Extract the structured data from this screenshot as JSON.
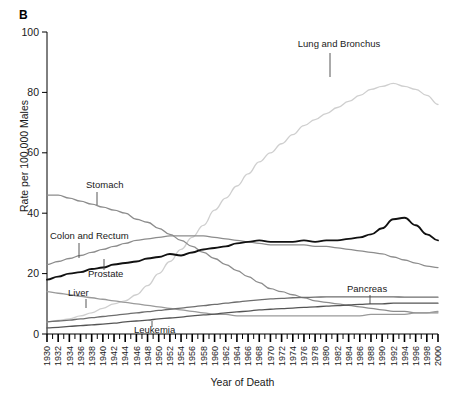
{
  "panel": {
    "letter": "B"
  },
  "axes": {
    "ylabel": "Rate per 100,000 Males",
    "xlabel": "Year of Death",
    "yticks": [
      "0",
      "20",
      "40",
      "60",
      "80",
      "100"
    ],
    "xticks": [
      "1930",
      "1932",
      "1934",
      "1936",
      "1938",
      "1940",
      "1942",
      "1944",
      "1946",
      "1948",
      "1950",
      "1952",
      "1954",
      "1956",
      "1958",
      "1960",
      "1962",
      "1964",
      "1966",
      "1968",
      "1970",
      "1972",
      "1974",
      "1976",
      "1978",
      "1980",
      "1982",
      "1984",
      "1986",
      "1988",
      "1990",
      "1992",
      "1994",
      "1996",
      "1998",
      "2000"
    ]
  },
  "annotations": [
    {
      "name": "lung-and-bronchus",
      "label": "Lung and Bronchus"
    },
    {
      "name": "stomach",
      "label": "Stomach"
    },
    {
      "name": "colon-and-rectum",
      "label": "Colon and Rectum"
    },
    {
      "name": "prostate",
      "label": "Prostate"
    },
    {
      "name": "liver",
      "label": "Liver"
    },
    {
      "name": "leukemia",
      "label": "Leukemia"
    },
    {
      "name": "pancreas",
      "label": "Pancreas"
    }
  ],
  "colors": {
    "lung": "#cfcfcf",
    "stomach": "#8c8c8c",
    "colon": "#8c8c8c",
    "prostate": "#111111",
    "liver": "#9a9a9a",
    "leukemia": "#555555",
    "pancreas": "#6e6e6e",
    "axis": "#000000",
    "text": "#1a1a1a"
  },
  "chart_data": {
    "type": "line",
    "title": "",
    "subtitle": "",
    "xlabel": "Year of Death",
    "ylabel": "Rate per 100,000 Males",
    "xlim": [
      1930,
      2000
    ],
    "ylim": [
      0,
      100
    ],
    "grid": false,
    "legend": "inline-annotations",
    "x": [
      1930,
      1932,
      1934,
      1936,
      1938,
      1940,
      1942,
      1944,
      1946,
      1948,
      1950,
      1952,
      1954,
      1956,
      1958,
      1960,
      1962,
      1964,
      1966,
      1968,
      1970,
      1972,
      1974,
      1976,
      1978,
      1980,
      1982,
      1984,
      1986,
      1988,
      1990,
      1992,
      1994,
      1996,
      1998,
      2000
    ],
    "series": [
      {
        "name": "Lung and Bronchus",
        "color": "#cfcfcf",
        "values": [
          4,
          4.5,
          5,
          6,
          7,
          8.5,
          10,
          11,
          13,
          16,
          20,
          24,
          28,
          32,
          36,
          41,
          45,
          49,
          53,
          57,
          60,
          63,
          66,
          69,
          71,
          73,
          75,
          77,
          79,
          81,
          82,
          83,
          82,
          81,
          79,
          76
        ]
      },
      {
        "name": "Stomach",
        "color": "#8c8c8c",
        "values": [
          46,
          46,
          45,
          44,
          43,
          42,
          41,
          40,
          38,
          37,
          35,
          33,
          31,
          29,
          27,
          25,
          23,
          21,
          19,
          17,
          15,
          14,
          13,
          12,
          11,
          10.5,
          10,
          9.5,
          9,
          8.5,
          8,
          7.5,
          7.5,
          7,
          7,
          7
        ]
      },
      {
        "name": "Colon and Rectum",
        "color": "#8c8c8c",
        "values": [
          23,
          24,
          25,
          26,
          27,
          28,
          29,
          30,
          31,
          31.5,
          32,
          32.5,
          32.5,
          32.5,
          32.5,
          32,
          31.5,
          31,
          30.5,
          30,
          29.5,
          29.5,
          29.5,
          29.5,
          29,
          29,
          28.5,
          28,
          27.5,
          27,
          26.5,
          25.5,
          24.5,
          23.5,
          22.5,
          22
        ]
      },
      {
        "name": "Prostate",
        "color": "#111111",
        "values": [
          18,
          19,
          20,
          20.5,
          21.5,
          22,
          23,
          23.5,
          24,
          25,
          25.5,
          26.5,
          26,
          27,
          28,
          28.5,
          29,
          30,
          30.5,
          31,
          30.5,
          30.5,
          30.5,
          31,
          30.5,
          31,
          31,
          31.5,
          32,
          33,
          35,
          38,
          38.5,
          36,
          33,
          31
        ]
      },
      {
        "name": "Liver",
        "color": "#9a9a9a",
        "values": [
          14,
          13.5,
          13,
          12.5,
          12,
          11.5,
          11,
          10.5,
          10,
          9.5,
          9,
          8.5,
          8,
          7.5,
          7,
          6.5,
          6.5,
          6,
          6,
          6,
          6,
          6,
          6,
          6,
          6,
          6,
          6,
          6,
          6,
          6.5,
          6.5,
          6.5,
          6.5,
          7,
          7,
          7.5
        ]
      },
      {
        "name": "Leukemia",
        "color": "#555555",
        "values": [
          2,
          2.2,
          2.5,
          2.8,
          3,
          3.3,
          3.6,
          4,
          4.3,
          4.6,
          5,
          5.3,
          5.6,
          6,
          6.3,
          6.6,
          7,
          7.3,
          7.6,
          8,
          8.2,
          8.4,
          8.6,
          8.8,
          9,
          9.2,
          9.4,
          9.6,
          9.8,
          10,
          10,
          10.2,
          10.2,
          10.2,
          10.2,
          10.2
        ]
      },
      {
        "name": "Pancreas",
        "color": "#6e6e6e",
        "values": [
          4,
          4.3,
          4.6,
          5,
          5.4,
          5.8,
          6.2,
          6.6,
          7,
          7.4,
          7.8,
          8.2,
          8.6,
          9,
          9.4,
          9.8,
          10.2,
          10.6,
          11,
          11.3,
          11.6,
          11.8,
          12,
          12.1,
          12.2,
          12.3,
          12.3,
          12.3,
          12.3,
          12.3,
          12.3,
          12.3,
          12.2,
          12.2,
          12.2,
          12.2
        ]
      }
    ]
  }
}
